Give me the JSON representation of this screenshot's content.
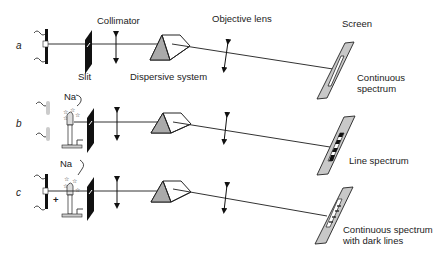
{
  "labels": {
    "collimator": "Collimator",
    "objective_lens": "Objective lens",
    "screen": "Screen",
    "slit": "Slit",
    "dispersive_system": "Dispersive system",
    "na_b": "Na",
    "na_c": "Na",
    "plus": "+"
  },
  "rows": [
    {
      "id": "a",
      "label": "a",
      "source": "lamp",
      "result_line1": "Continuous",
      "result_line2": "spectrum"
    },
    {
      "id": "b",
      "label": "b",
      "source": "sodium flame",
      "result_line1": "Line spectrum",
      "result_line2": ""
    },
    {
      "id": "c",
      "label": "c",
      "source": "lamp + sodium flame",
      "result_line1": "Continuous spectrum",
      "result_line2": "with dark lines"
    }
  ],
  "colors": {
    "ink": "#222222",
    "screen_fill": "#c8c8c8",
    "prism_shade": "#aaaaaa",
    "background": "#ffffff"
  }
}
